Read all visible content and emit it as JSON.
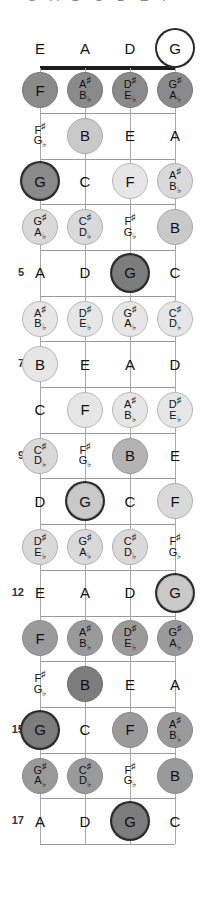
{
  "diagram": {
    "title_cutoff": "G A B C D E F",
    "instrument": "bass-fretboard",
    "string_labels": [
      "E",
      "A",
      "D",
      "G"
    ],
    "fret_numbers": [
      "5",
      "7",
      "9",
      "12",
      "15",
      "17"
    ],
    "root_note": "G",
    "colors": {
      "nut": "#1c1c1c",
      "fret": "#9a9a9a",
      "string": "#a8a8a8",
      "root_ring": "#2a2a2a",
      "text": "#111111"
    }
  },
  "chart_data": {
    "type": "table",
    "xlabel": "Strings",
    "ylabel": "Frets",
    "categories": [
      "E",
      "A",
      "D",
      "G"
    ],
    "frets": [
      0,
      1,
      2,
      3,
      4,
      5,
      6,
      7,
      8,
      9,
      10,
      11,
      12,
      13,
      14,
      15,
      16,
      17
    ],
    "rows": [
      {
        "fret": 0,
        "label": "",
        "notes": [
          {
            "name": "E",
            "sharp": "",
            "flat": "",
            "fill": "none",
            "root": false
          },
          {
            "name": "A",
            "sharp": "",
            "flat": "",
            "fill": "none",
            "root": false
          },
          {
            "name": "D",
            "sharp": "",
            "flat": "",
            "fill": "none",
            "root": false
          },
          {
            "name": "G",
            "sharp": "",
            "flat": "",
            "fill": "none",
            "root": true
          }
        ]
      },
      {
        "fret": 1,
        "label": "",
        "notes": [
          {
            "name": "F",
            "sharp": "",
            "flat": "",
            "fill": "dark",
            "root": false
          },
          {
            "name": "",
            "sharp": "A#",
            "flat": "B♭",
            "fill": "dark",
            "root": false
          },
          {
            "name": "",
            "sharp": "D#",
            "flat": "E♭",
            "fill": "dark",
            "root": false
          },
          {
            "name": "",
            "sharp": "G#",
            "flat": "A♭",
            "fill": "dark",
            "root": false
          }
        ]
      },
      {
        "fret": 2,
        "label": "",
        "notes": [
          {
            "name": "",
            "sharp": "F#",
            "flat": "G♭",
            "fill": "none",
            "root": false
          },
          {
            "name": "B",
            "sharp": "",
            "flat": "",
            "fill": "mlight",
            "root": false
          },
          {
            "name": "E",
            "sharp": "",
            "flat": "",
            "fill": "none",
            "root": false
          },
          {
            "name": "A",
            "sharp": "",
            "flat": "",
            "fill": "none",
            "root": false
          }
        ]
      },
      {
        "fret": 3,
        "label": "",
        "notes": [
          {
            "name": "G",
            "sharp": "",
            "flat": "",
            "fill": "dark",
            "root": true
          },
          {
            "name": "C",
            "sharp": "",
            "flat": "",
            "fill": "none",
            "root": false
          },
          {
            "name": "F",
            "sharp": "",
            "flat": "",
            "fill": "vlight",
            "root": false
          },
          {
            "name": "",
            "sharp": "A#",
            "flat": "B♭",
            "fill": "light",
            "root": false
          }
        ]
      },
      {
        "fret": 4,
        "label": "",
        "notes": [
          {
            "name": "",
            "sharp": "G#",
            "flat": "A♭",
            "fill": "light",
            "root": false
          },
          {
            "name": "",
            "sharp": "C#",
            "flat": "D♭",
            "fill": "light",
            "root": false
          },
          {
            "name": "",
            "sharp": "F#",
            "flat": "G♭",
            "fill": "none",
            "root": false
          },
          {
            "name": "B",
            "sharp": "",
            "flat": "",
            "fill": "mlight",
            "root": false
          }
        ]
      },
      {
        "fret": 5,
        "label": "5",
        "notes": [
          {
            "name": "A",
            "sharp": "",
            "flat": "",
            "fill": "none",
            "root": false
          },
          {
            "name": "D",
            "sharp": "",
            "flat": "",
            "fill": "none",
            "root": false
          },
          {
            "name": "G",
            "sharp": "",
            "flat": "",
            "fill": "ddark",
            "root": true
          },
          {
            "name": "C",
            "sharp": "",
            "flat": "",
            "fill": "none",
            "root": false
          }
        ]
      },
      {
        "fret": 6,
        "label": "",
        "notes": [
          {
            "name": "",
            "sharp": "A#",
            "flat": "B♭",
            "fill": "vlight",
            "root": false
          },
          {
            "name": "",
            "sharp": "D#",
            "flat": "E♭",
            "fill": "vlight",
            "root": false
          },
          {
            "name": "",
            "sharp": "G#",
            "flat": "A♭",
            "fill": "vlight",
            "root": false
          },
          {
            "name": "",
            "sharp": "C#",
            "flat": "D♭",
            "fill": "vlight",
            "root": false
          }
        ]
      },
      {
        "fret": 7,
        "label": "7",
        "notes": [
          {
            "name": "B",
            "sharp": "",
            "flat": "",
            "fill": "vlight",
            "root": false
          },
          {
            "name": "E",
            "sharp": "",
            "flat": "",
            "fill": "none",
            "root": false
          },
          {
            "name": "A",
            "sharp": "",
            "flat": "",
            "fill": "none",
            "root": false
          },
          {
            "name": "D",
            "sharp": "",
            "flat": "",
            "fill": "none",
            "root": false
          }
        ]
      },
      {
        "fret": 8,
        "label": "",
        "notes": [
          {
            "name": "C",
            "sharp": "",
            "flat": "",
            "fill": "none",
            "root": false
          },
          {
            "name": "F",
            "sharp": "",
            "flat": "",
            "fill": "vlight",
            "root": false
          },
          {
            "name": "",
            "sharp": "A#",
            "flat": "B♭",
            "fill": "vlight",
            "root": false
          },
          {
            "name": "",
            "sharp": "D#",
            "flat": "E♭",
            "fill": "vlight",
            "root": false
          }
        ]
      },
      {
        "fret": 9,
        "label": "9",
        "notes": [
          {
            "name": "",
            "sharp": "C#",
            "flat": "D♭",
            "fill": "light",
            "root": false
          },
          {
            "name": "",
            "sharp": "F#",
            "flat": "G♭",
            "fill": "none",
            "root": false
          },
          {
            "name": "B",
            "sharp": "",
            "flat": "",
            "fill": "med",
            "root": false
          },
          {
            "name": "E",
            "sharp": "",
            "flat": "",
            "fill": "none",
            "root": false
          }
        ]
      },
      {
        "fret": 10,
        "label": "",
        "notes": [
          {
            "name": "D",
            "sharp": "",
            "flat": "",
            "fill": "none",
            "root": false
          },
          {
            "name": "G",
            "sharp": "",
            "flat": "",
            "fill": "mlight",
            "root": true
          },
          {
            "name": "C",
            "sharp": "",
            "flat": "",
            "fill": "none",
            "root": false
          },
          {
            "name": "F",
            "sharp": "",
            "flat": "",
            "fill": "light",
            "root": false
          }
        ]
      },
      {
        "fret": 11,
        "label": "",
        "notes": [
          {
            "name": "",
            "sharp": "D#",
            "flat": "E♭",
            "fill": "light",
            "root": false
          },
          {
            "name": "",
            "sharp": "G#",
            "flat": "A♭",
            "fill": "light",
            "root": false
          },
          {
            "name": "",
            "sharp": "C#",
            "flat": "D♭",
            "fill": "light",
            "root": false
          },
          {
            "name": "",
            "sharp": "F#",
            "flat": "G♭",
            "fill": "none",
            "root": false
          }
        ]
      },
      {
        "fret": 12,
        "label": "12",
        "notes": [
          {
            "name": "E",
            "sharp": "",
            "flat": "",
            "fill": "none",
            "root": false
          },
          {
            "name": "A",
            "sharp": "",
            "flat": "",
            "fill": "none",
            "root": false
          },
          {
            "name": "D",
            "sharp": "",
            "flat": "",
            "fill": "none",
            "root": false
          },
          {
            "name": "G",
            "sharp": "",
            "flat": "",
            "fill": "mlight",
            "root": true
          }
        ]
      },
      {
        "fret": 13,
        "label": "",
        "notes": [
          {
            "name": "F",
            "sharp": "",
            "flat": "",
            "fill": "mdark",
            "root": false
          },
          {
            "name": "",
            "sharp": "A#",
            "flat": "B♭",
            "fill": "mdark",
            "root": false
          },
          {
            "name": "",
            "sharp": "D#",
            "flat": "E♭",
            "fill": "mdark",
            "root": false
          },
          {
            "name": "",
            "sharp": "G#",
            "flat": "A♭",
            "fill": "mdark",
            "root": false
          }
        ]
      },
      {
        "fret": 14,
        "label": "",
        "notes": [
          {
            "name": "",
            "sharp": "F#",
            "flat": "G♭",
            "fill": "none",
            "root": false
          },
          {
            "name": "B",
            "sharp": "",
            "flat": "",
            "fill": "ddark",
            "root": false
          },
          {
            "name": "E",
            "sharp": "",
            "flat": "",
            "fill": "none",
            "root": false
          },
          {
            "name": "A",
            "sharp": "",
            "flat": "",
            "fill": "none",
            "root": false
          }
        ]
      },
      {
        "fret": 15,
        "label": "15",
        "notes": [
          {
            "name": "G",
            "sharp": "",
            "flat": "",
            "fill": "ddark",
            "root": true
          },
          {
            "name": "C",
            "sharp": "",
            "flat": "",
            "fill": "none",
            "root": false
          },
          {
            "name": "F",
            "sharp": "",
            "flat": "",
            "fill": "mdark",
            "root": false
          },
          {
            "name": "",
            "sharp": "A#",
            "flat": "B♭",
            "fill": "mdark",
            "root": false
          }
        ]
      },
      {
        "fret": 16,
        "label": "",
        "notes": [
          {
            "name": "",
            "sharp": "G#",
            "flat": "A♭",
            "fill": "mdark",
            "root": false
          },
          {
            "name": "",
            "sharp": "C#",
            "flat": "D♭",
            "fill": "mdark",
            "root": false
          },
          {
            "name": "",
            "sharp": "F#",
            "flat": "G♭",
            "fill": "none",
            "root": false
          },
          {
            "name": "B",
            "sharp": "",
            "flat": "",
            "fill": "mdark",
            "root": false
          }
        ]
      },
      {
        "fret": 17,
        "label": "17",
        "notes": [
          {
            "name": "A",
            "sharp": "",
            "flat": "",
            "fill": "none",
            "root": false
          },
          {
            "name": "D",
            "sharp": "",
            "flat": "",
            "fill": "none",
            "root": false
          },
          {
            "name": "G",
            "sharp": "",
            "flat": "",
            "fill": "ddark",
            "root": true
          },
          {
            "name": "C",
            "sharp": "",
            "flat": "",
            "fill": "none",
            "root": false
          }
        ]
      }
    ]
  }
}
